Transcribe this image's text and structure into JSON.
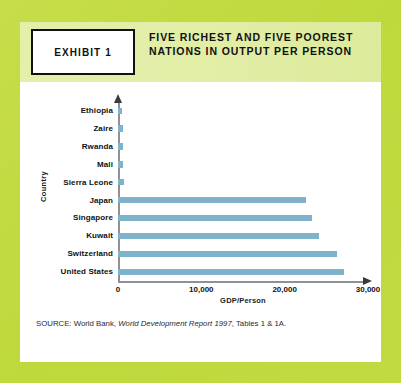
{
  "exhibit": {
    "badge": "EXHIBIT 1",
    "title": "FIVE RICHEST AND FIVE POOREST NATIONS IN OUTPUT PER PERSON"
  },
  "source": {
    "prefix": "SOURCE: World Bank, ",
    "italic": "World Development Report 1997",
    "suffix": ", Tables 1 & 1A."
  },
  "colors": {
    "frame_green": "#c3db44",
    "header_band": "#e2eda6",
    "bar": "#7fb2cb",
    "axis": "#8e9196",
    "text": "#111111",
    "card": "#ffffff"
  },
  "chart_data": {
    "type": "bar",
    "orientation": "horizontal",
    "title": "Five Richest and Five Poorest Nations in Output per Person",
    "xlabel": "GDP/Person",
    "ylabel": "Country",
    "xlim": [
      0,
      30000
    ],
    "xticks": [
      0,
      10000,
      20000,
      30000
    ],
    "xtick_labels": [
      "0",
      "10,000",
      "20,000",
      "30,000"
    ],
    "grid": false,
    "legend": false,
    "categories": [
      "Ethiopia",
      "Zaire",
      "Rwanda",
      "Mali",
      "Sierra Leone",
      "Japan",
      "Singapore",
      "Kuwait",
      "Switzerland",
      "United States"
    ],
    "values": [
      500,
      550,
      600,
      650,
      700,
      22600,
      23300,
      24100,
      26300,
      27100
    ],
    "series_name": "GDP/Person",
    "bars": [
      {
        "label": "Ethiopia",
        "value": 500
      },
      {
        "label": "Zaire",
        "value": 550
      },
      {
        "label": "Rwanda",
        "value": 600
      },
      {
        "label": "Mali",
        "value": 650
      },
      {
        "label": "Sierra Leone",
        "value": 700
      },
      {
        "label": "Japan",
        "value": 22600
      },
      {
        "label": "Singapore",
        "value": 23300
      },
      {
        "label": "Kuwait",
        "value": 24100
      },
      {
        "label": "Switzerland",
        "value": 26300
      },
      {
        "label": "United States",
        "value": 27100
      }
    ]
  }
}
